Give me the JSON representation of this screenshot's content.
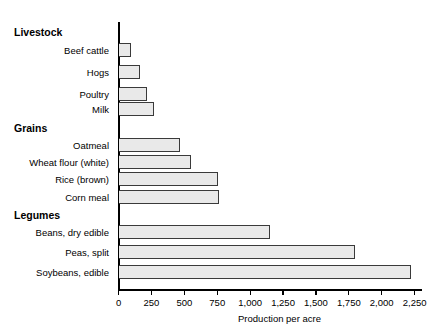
{
  "chart_data": {
    "type": "bar",
    "orientation": "horizontal",
    "title": "",
    "xlabel": "Production per acre",
    "ylabel": "",
    "xlim": [
      0,
      2250
    ],
    "xticks": [
      0,
      250,
      500,
      750,
      1000,
      1250,
      1500,
      1750,
      2000,
      2250
    ],
    "xtick_labels": [
      "0",
      "250",
      "500",
      "750",
      "1,000",
      "1,250",
      "1,500",
      "1,750",
      "2,000",
      "2,250"
    ],
    "grid": false,
    "legend": null,
    "bar_fill_color": "#e9e9e9",
    "bar_edge_color": "#3a3a3a",
    "axis_color": "#000000",
    "groups": [
      {
        "name": "Livestock",
        "items": [
          {
            "label": "Beef cattle",
            "value": 90
          },
          {
            "label": "Hogs",
            "value": 160
          },
          {
            "label": "Poultry",
            "value": 210
          },
          {
            "label": "Milk",
            "value": 265
          }
        ]
      },
      {
        "name": "Grains",
        "items": [
          {
            "label": "Oatmeal",
            "value": 460
          },
          {
            "label": "Wheat flour (white)",
            "value": 545
          },
          {
            "label": "Rice (brown)",
            "value": 750
          },
          {
            "label": "Corn meal",
            "value": 760
          }
        ]
      },
      {
        "name": "Legumes",
        "items": [
          {
            "label": "Beans, dry edible",
            "value": 1150
          },
          {
            "label": "Peas, split",
            "value": 1795
          },
          {
            "label": "Soybeans, edible",
            "value": 2220
          }
        ]
      }
    ],
    "categories": [
      "Beef cattle",
      "Hogs",
      "Poultry",
      "Milk",
      "Oatmeal",
      "Wheat flour (white)",
      "Rice (brown)",
      "Corn meal",
      "Beans, dry edible",
      "Peas, split",
      "Soybeans, edible"
    ],
    "values": [
      90,
      160,
      210,
      265,
      460,
      545,
      750,
      760,
      1150,
      1795,
      2220
    ]
  }
}
